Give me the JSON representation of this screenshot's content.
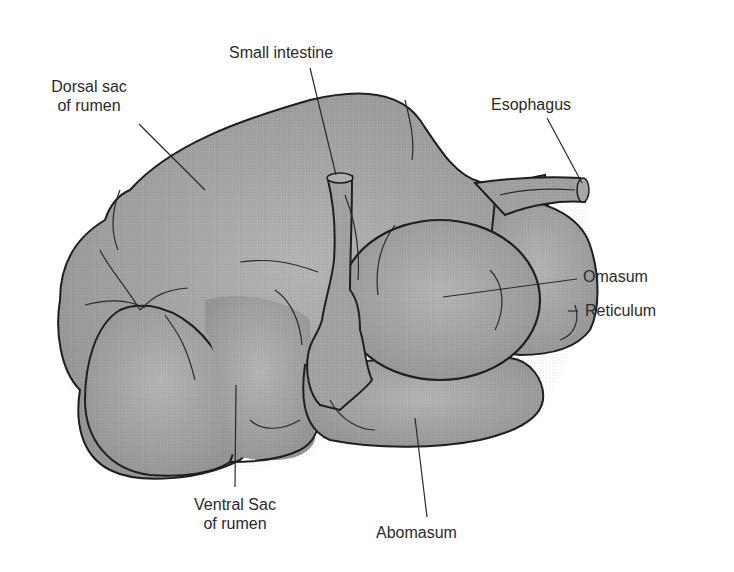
{
  "figure": {
    "colors": {
      "organ_fill": "#9a9a9a",
      "organ_highlight": "#b8b8b8",
      "outline": "#1e1e1e",
      "leader_line": "#2a2a2a",
      "text": "#2a2a2a",
      "background": "#ffffff"
    }
  },
  "labels": {
    "small_intestine": "Small intestine",
    "dorsal_sac_line1": "Dorsal sac",
    "dorsal_sac_line2": "of  rumen",
    "esophagus": "Esophagus",
    "omasum": "Omasum",
    "reticulum": "Reticulum",
    "ventral_sac_line1": "Ventral Sac",
    "ventral_sac_line2": "of rumen",
    "abomasum": "Abomasum"
  }
}
